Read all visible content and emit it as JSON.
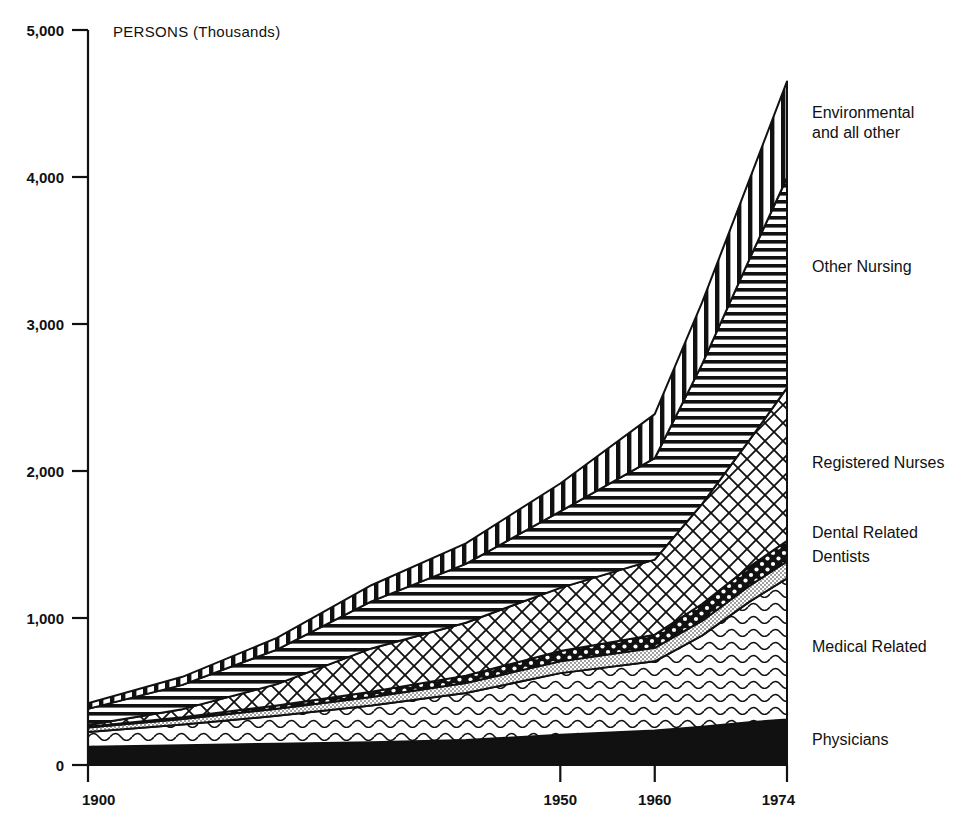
{
  "chart_data": {
    "type": "area",
    "title": "",
    "subtitle": "",
    "unit_note": "PERSONS (Thousands)",
    "xlabel": "",
    "ylabel": "",
    "stacked": true,
    "grid": false,
    "legend_position": "right-inline",
    "x": [
      1900,
      1910,
      1920,
      1930,
      1940,
      1950,
      1960,
      1965,
      1970,
      1974
    ],
    "xlim": [
      1900,
      1974
    ],
    "ylim": [
      0,
      5000
    ],
    "xticks": [
      1900,
      1950,
      1960,
      1974
    ],
    "xtick_labels": [
      "1900",
      "1950",
      "1960",
      "1974"
    ],
    "yticks": [
      0,
      1000,
      2000,
      3000,
      4000,
      5000
    ],
    "ytick_labels": [
      "0",
      "1,000",
      "2,000",
      "3,000",
      "4,000",
      "5,000"
    ],
    "series": [
      {
        "name": "Physicians",
        "label": "Physicians",
        "pattern": "solid-black",
        "values": [
          125,
          135,
          145,
          155,
          170,
          205,
          235,
          260,
          290,
          310
        ]
      },
      {
        "name": "Medical Related",
        "label": "Medical Related",
        "pattern": "wavy-lines",
        "values": [
          100,
          140,
          190,
          250,
          320,
          420,
          470,
          620,
          820,
          960
        ]
      },
      {
        "name": "Dentists",
        "label": "Dentists",
        "pattern": "fine-stipple",
        "values": [
          30,
          38,
          48,
          58,
          68,
          80,
          92,
          100,
          108,
          115
        ]
      },
      {
        "name": "Dental Related",
        "label": "Dental Related",
        "pattern": "coarse-dots",
        "values": [
          5,
          12,
          22,
          35,
          50,
          70,
          90,
          115,
          130,
          140
        ]
      },
      {
        "name": "Registered Nurses",
        "label": "Registered Nurses",
        "pattern": "diagonal-crosshatch",
        "values": [
          12,
          55,
          145,
          295,
          360,
          430,
          510,
          680,
          860,
          1040
        ]
      },
      {
        "name": "Other Nursing",
        "label": "Other Nursing",
        "pattern": "horizontal-lines",
        "values": [
          110,
          165,
          235,
          320,
          400,
          520,
          690,
          950,
          1230,
          1430
        ]
      },
      {
        "name": "Environmental and all other",
        "label": "Environmental\nand all other",
        "pattern": "vertical-lines",
        "values": [
          38,
          55,
          80,
          110,
          140,
          190,
          300,
          420,
          540,
          655
        ]
      }
    ],
    "totals": [
      420,
      600,
      865,
      1223,
      1508,
      1915,
      2387,
      3145,
      3978,
      4650
    ],
    "series_labels_right": [
      "Environmental and all other",
      "Other Nursing",
      "Registered Nurses",
      "Dental Related",
      "Dentists",
      "Medical Related",
      "Physicians"
    ],
    "colors": {
      "ink": "#111111",
      "background": "#ffffff"
    }
  }
}
